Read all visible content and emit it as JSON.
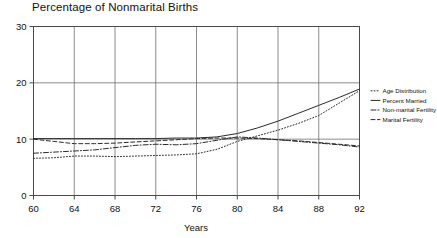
{
  "chart_data": {
    "type": "line",
    "title": "Percentage of Nonmarital Births",
    "xlabel": "Years",
    "ylabel": "",
    "xlim": [
      60,
      92
    ],
    "ylim": [
      0,
      30
    ],
    "xticks": [
      60,
      64,
      68,
      72,
      76,
      80,
      84,
      88,
      92
    ],
    "yticks": [
      0,
      10,
      20,
      30
    ],
    "xtick_labels": [
      "60",
      "64",
      "68",
      "72",
      "76",
      "80",
      "84",
      "88",
      "92"
    ],
    "ytick_labels": [
      "0",
      "10",
      "20",
      "30"
    ],
    "grid": "vertical gridlines at 64,68,72,76,80,84,88; horizontal gridlines at 10 and 20",
    "legend_position": "right outside",
    "x": [
      60,
      62,
      64,
      66,
      68,
      70,
      72,
      74,
      76,
      78,
      80,
      82,
      84,
      86,
      88,
      90,
      92
    ],
    "series": [
      {
        "name": "Age Distribution",
        "style": "dotted",
        "values": [
          6.6,
          6.7,
          7.0,
          7.0,
          6.9,
          7.0,
          7.1,
          7.2,
          7.4,
          8.2,
          9.6,
          10.6,
          11.6,
          12.8,
          14.2,
          16.4,
          18.6
        ]
      },
      {
        "name": "Percent Married",
        "style": "solid",
        "values": [
          10.1,
          10.1,
          10.1,
          10.1,
          10.1,
          10.1,
          10.1,
          10.2,
          10.2,
          10.4,
          11.0,
          12.0,
          13.2,
          14.6,
          16.0,
          17.4,
          18.9
        ]
      },
      {
        "name": "Non-marital Fertility",
        "style": "dash-dot",
        "values": [
          7.5,
          7.7,
          7.9,
          8.1,
          8.5,
          8.9,
          9.1,
          9.0,
          9.2,
          9.8,
          10.4,
          10.2,
          9.9,
          9.6,
          9.3,
          9.0,
          8.6
        ]
      },
      {
        "name": "Marital Fertility",
        "style": "dashed",
        "values": [
          10.0,
          9.6,
          9.2,
          9.2,
          9.3,
          9.5,
          9.7,
          9.9,
          10.1,
          10.2,
          10.2,
          10.1,
          9.9,
          9.7,
          9.4,
          9.1,
          8.8
        ]
      }
    ]
  },
  "legend": {
    "items": [
      {
        "label": "Age Distribution"
      },
      {
        "label": "Percent Married"
      },
      {
        "label": "Non-marital Fertility"
      },
      {
        "label": "Marital Fertility"
      }
    ]
  }
}
